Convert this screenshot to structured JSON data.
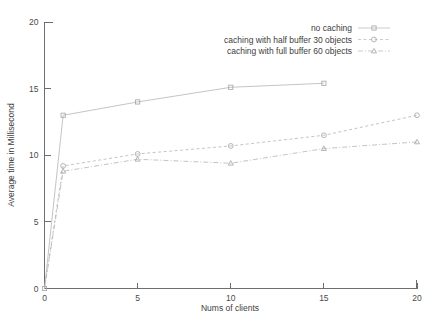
{
  "chart_data": {
    "type": "line",
    "title": "",
    "xlabel": "Nums of clients",
    "ylabel": "Average time in Millisecond",
    "xlim": [
      0,
      20
    ],
    "ylim": [
      0,
      20
    ],
    "xticks": [
      0,
      5,
      10,
      15,
      20
    ],
    "yticks": [
      0,
      5,
      10,
      15,
      20
    ],
    "xtick_labels": [
      "0",
      "5",
      "10",
      "15",
      "20"
    ],
    "ytick_labels": [
      "0",
      "5",
      "10",
      "15",
      "20"
    ],
    "grid": false,
    "legend_position": "top-right",
    "series": [
      {
        "name": "no caching",
        "marker": "square",
        "linestyle": "solid",
        "x": [
          0,
          1,
          5,
          10,
          15
        ],
        "values": [
          0,
          13.0,
          14.0,
          15.1,
          15.4
        ]
      },
      {
        "name": "caching with half buffer 30 objects",
        "marker": "circle",
        "linestyle": "dashed",
        "x": [
          0,
          1,
          5,
          10,
          15,
          20
        ],
        "values": [
          0,
          9.2,
          10.1,
          10.7,
          11.5,
          13.0
        ]
      },
      {
        "name": "caching with full buffer 60 objects",
        "marker": "triangle",
        "linestyle": "dashdot",
        "x": [
          0,
          1,
          5,
          10,
          15,
          20
        ],
        "values": [
          0,
          8.8,
          9.7,
          9.4,
          10.5,
          11.0
        ]
      }
    ]
  },
  "legend": {
    "entries": [
      {
        "label": "no caching"
      },
      {
        "label": "caching with half buffer 30 objects"
      },
      {
        "label": "caching with full buffer 60 objects"
      }
    ]
  },
  "axes": {
    "x_title": "Nums of clients",
    "y_title": "Average time in Millisecond"
  },
  "colors": {
    "line": "#b9b9b9",
    "marker": "#a8a8a8",
    "axis": "#6e6e6e",
    "text": "#3d3d3d",
    "background": "#ffffff"
  }
}
